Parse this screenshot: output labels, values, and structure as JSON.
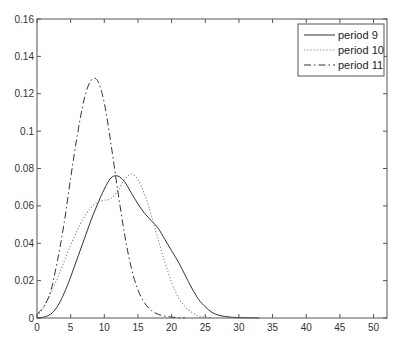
{
  "chart_data": {
    "type": "line",
    "title": "",
    "xlabel": "",
    "ylabel": "",
    "xlim": [
      0,
      52
    ],
    "ylim": [
      0,
      0.16
    ],
    "grid": false,
    "legend_position": "upper right",
    "x_ticks": [
      0,
      5,
      10,
      15,
      20,
      25,
      30,
      35,
      40,
      45,
      50
    ],
    "x_tick_labels": [
      "0",
      "5",
      "10",
      "15",
      "20",
      "25",
      "30",
      "35",
      "40",
      "45",
      "50"
    ],
    "y_ticks": [
      0,
      0.02,
      0.04,
      0.06,
      0.08,
      0.1,
      0.12,
      0.14,
      0.16
    ],
    "y_tick_labels": [
      "0",
      "0.02",
      "0.04",
      "0.06",
      "0.08",
      "0.1",
      "0.12",
      "0.14",
      "0.16"
    ],
    "series": [
      {
        "name": "period 9",
        "style": "solid",
        "color": "#333333",
        "x": [
          0,
          1,
          2,
          3,
          4,
          5,
          6,
          7,
          8,
          9,
          10,
          11,
          12,
          13,
          14,
          15,
          16,
          17,
          18,
          19,
          20,
          21,
          22,
          23,
          24,
          25,
          26,
          27,
          28,
          29,
          30,
          31,
          32,
          33
        ],
        "values": [
          0,
          0.0005,
          0.002,
          0.006,
          0.013,
          0.022,
          0.032,
          0.042,
          0.052,
          0.061,
          0.069,
          0.075,
          0.076,
          0.073,
          0.067,
          0.061,
          0.056,
          0.052,
          0.048,
          0.042,
          0.036,
          0.03,
          0.023,
          0.016,
          0.01,
          0.006,
          0.003,
          0.0015,
          0.0008,
          0.0004,
          0.0002,
          0.0001,
          0.0001,
          0
        ]
      },
      {
        "name": "period 10",
        "style": "dotted",
        "color": "#888888",
        "x": [
          0,
          1,
          2,
          3,
          4,
          5,
          6,
          7,
          8,
          9,
          10,
          11,
          12,
          13,
          14,
          15,
          16,
          17,
          18,
          19,
          20,
          21,
          22,
          23,
          24,
          25,
          26
        ],
        "values": [
          0.001,
          0.006,
          0.013,
          0.021,
          0.03,
          0.039,
          0.047,
          0.054,
          0.059,
          0.062,
          0.063,
          0.064,
          0.068,
          0.074,
          0.077,
          0.074,
          0.066,
          0.055,
          0.042,
          0.03,
          0.019,
          0.011,
          0.006,
          0.003,
          0.001,
          0.0005,
          0
        ]
      },
      {
        "name": "period 11",
        "style": "dashdot",
        "color": "#333333",
        "x": [
          0,
          1,
          2,
          3,
          4,
          5,
          6,
          7,
          8,
          9,
          10,
          11,
          12,
          13,
          14,
          15,
          16,
          17,
          18,
          19,
          20,
          21,
          22
        ],
        "values": [
          0.002,
          0.006,
          0.014,
          0.03,
          0.05,
          0.075,
          0.098,
          0.117,
          0.127,
          0.127,
          0.115,
          0.093,
          0.068,
          0.045,
          0.027,
          0.015,
          0.008,
          0.004,
          0.002,
          0.001,
          0.0005,
          0.0002,
          0
        ]
      }
    ]
  },
  "legend": {
    "items": [
      {
        "label": "period 9"
      },
      {
        "label": "period 10"
      },
      {
        "label": "period 11"
      }
    ]
  }
}
